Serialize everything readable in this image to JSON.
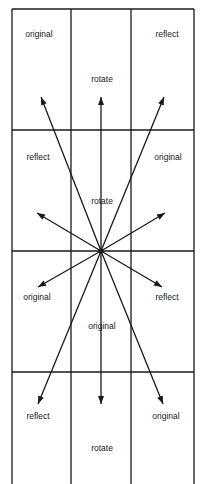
{
  "grid": {
    "columns_x": [
      12,
      71,
      131,
      194
    ],
    "rows_y": [
      9,
      130,
      251,
      372,
      484
    ],
    "line_color": "#1a1a1a"
  },
  "center": {
    "x": 101,
    "y": 251
  },
  "labels": [
    {
      "text": "original",
      "x": 39,
      "y": 35
    },
    {
      "text": "rotate",
      "x": 102,
      "y": 80
    },
    {
      "text": "reflect",
      "x": 167,
      "y": 35
    },
    {
      "text": "reflect",
      "x": 38,
      "y": 158
    },
    {
      "text": "original",
      "x": 168,
      "y": 158
    },
    {
      "text": "rotate",
      "x": 102,
      "y": 202
    },
    {
      "text": "original",
      "x": 37,
      "y": 298
    },
    {
      "text": "reflect",
      "x": 167,
      "y": 298
    },
    {
      "text": "original",
      "x": 102,
      "y": 327
    },
    {
      "text": "reflect",
      "x": 38,
      "y": 417
    },
    {
      "text": "original",
      "x": 166,
      "y": 417
    },
    {
      "text": "rotate",
      "x": 102,
      "y": 449
    }
  ],
  "arrows": [
    {
      "x": 41,
      "y": 97
    },
    {
      "x": 101,
      "y": 97
    },
    {
      "x": 164,
      "y": 97
    },
    {
      "x": 37,
      "y": 213
    },
    {
      "x": 165,
      "y": 213
    },
    {
      "x": 38,
      "y": 287
    },
    {
      "x": 162,
      "y": 287
    },
    {
      "x": 38,
      "y": 404
    },
    {
      "x": 101,
      "y": 404
    },
    {
      "x": 163,
      "y": 404
    }
  ]
}
